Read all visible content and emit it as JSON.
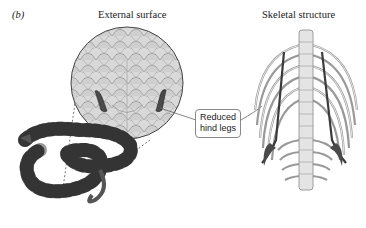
{
  "figure": {
    "panel_label": "(b)",
    "titles": {
      "external": "External surface",
      "skeletal": "Skeletal structure"
    },
    "callout": {
      "line1": "Reduced",
      "line2": "hind legs"
    },
    "colors": {
      "scale_fill": "#d6d6d6",
      "scale_stroke": "#9a9a9a",
      "bone_fill": "#e6e6e6",
      "bone_stroke": "#888888",
      "spur": "#4a4a4a",
      "snake_dark": "#222222",
      "snake_light": "#b0b0b0"
    }
  }
}
